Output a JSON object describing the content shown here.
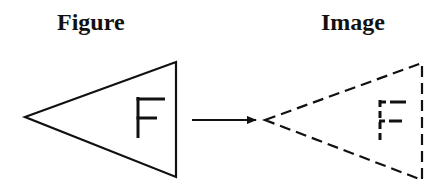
{
  "labels": {
    "figure": "Figure",
    "image": "Image"
  },
  "diagram": {
    "figure_letter": "F",
    "image_letter": "F",
    "figure_style": "solid",
    "image_style": "dashed",
    "arrow_direction": "right",
    "stroke_color": "#111111"
  }
}
